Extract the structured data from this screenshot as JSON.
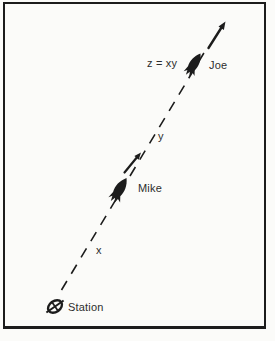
{
  "figure": {
    "colors": {
      "ink": "#1c1c1c",
      "paper": "#fbfbf9",
      "text": "#2d2d2d"
    },
    "labels": {
      "equation": "z = xy",
      "joe": "Joe",
      "segment_upper": "y",
      "mike": "Mike",
      "segment_lower": "x",
      "station": "Station"
    },
    "icons": {
      "joe_rocket": "rocket-icon",
      "mike_rocket": "rocket-icon",
      "heading_arrow_top": "arrow-up-right-icon",
      "heading_arrow_mid": "arrow-up-right-icon",
      "station_marker": "station-marker-icon"
    }
  }
}
